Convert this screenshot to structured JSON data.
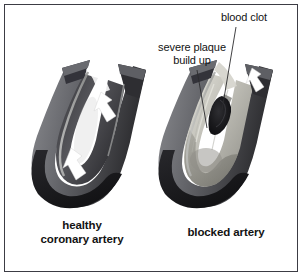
{
  "figure": {
    "background_color": "#ffffff",
    "border_color": "#3c3c44",
    "text_color": "#131313"
  },
  "callouts": [
    {
      "id": "blood-clot",
      "text": "blood clot",
      "leader": "vertical line from label down into the clot"
    },
    {
      "id": "severe-plaque-build-up",
      "text": "severe plaque\nbuild up",
      "leader": "diagonal line from label down-right into the plaque"
    }
  ],
  "captions": [
    {
      "id": "healthy-coronary-artery",
      "text": "healthy\ncoronary artery"
    },
    {
      "id": "blocked-artery",
      "text": "blocked artery"
    }
  ],
  "illustration": {
    "healthy_artery": {
      "wall_outer_color": "#1d1d1f",
      "wall_mid_color": "#6f7075",
      "lumen_color": "#4a4a4f",
      "highlight_color": "#b9bab9",
      "flow_arrows": 2,
      "arrow_color": "#ffffff",
      "arrow_direction": "down-left"
    },
    "blocked_artery": {
      "wall_outer_color": "#1d1d1f",
      "wall_mid_color": "#6f7075",
      "plaque_color": "#c9c8c2",
      "plaque_shadow_color": "#8e8d88",
      "clot_color": "#1b1b1d",
      "flow_arrows": 1,
      "arrow_color": "#ffffff",
      "arrow_direction": "down-left"
    }
  }
}
